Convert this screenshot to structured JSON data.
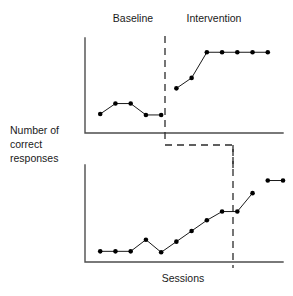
{
  "figure": {
    "title": "",
    "y_axis_label_lines": [
      "Number of",
      "correct",
      "responses"
    ],
    "x_axis_label": "Sessions",
    "phase_labels": {
      "baseline": "Baseline",
      "intervention": "Intervention"
    },
    "colors": {
      "axis": "#4d4d4d",
      "data_line": "#1a1a1a",
      "data_point": "#000000",
      "phase_line": "#2b2b2b",
      "background": "#ffffff",
      "text": "#1a1a1a"
    }
  },
  "chart_data": {
    "type": "line",
    "title": "",
    "xlabel": "Sessions",
    "ylabel": "Number of correct responses",
    "grid": false,
    "legend": false,
    "axis_ticks": false,
    "design": "multiple-baseline",
    "phases": [
      "Baseline",
      "Intervention"
    ],
    "panels": [
      {
        "name": "top-panel",
        "phase_change_session": 5.5,
        "xlim": [
          0,
          13
        ],
        "ylim": [
          0,
          10
        ],
        "series": [
          {
            "name": "Baseline",
            "x": [
              1,
              2,
              3,
              4,
              5
            ],
            "values": [
              2.0,
              3.1,
              3.1,
              1.9,
              1.9
            ]
          },
          {
            "name": "Intervention",
            "x": [
              6,
              7,
              8,
              9,
              10,
              11,
              12
            ],
            "values": [
              4.7,
              5.8,
              8.5,
              8.5,
              8.5,
              8.5,
              8.5
            ]
          }
        ]
      },
      {
        "name": "bottom-panel",
        "phase_change_session": 11.5,
        "xlim": [
          0,
          13
        ],
        "ylim": [
          0,
          10
        ],
        "series": [
          {
            "name": "Baseline",
            "x": [
              1,
              2,
              3,
              4,
              5,
              6,
              7,
              8,
              9,
              10,
              11
            ],
            "values": [
              1.1,
              1.1,
              1.1,
              2.3,
              1.0,
              2.1,
              3.2,
              4.3,
              5.2,
              5.2,
              7.1
            ]
          },
          {
            "name": "Intervention",
            "x": [
              12,
              13
            ],
            "values": [
              8.4,
              8.4
            ]
          }
        ]
      }
    ]
  }
}
